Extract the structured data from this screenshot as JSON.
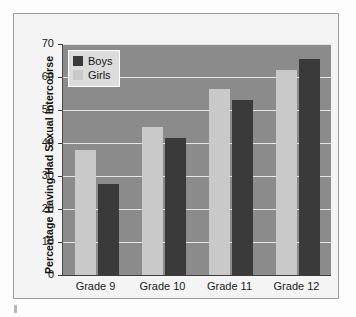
{
  "chart_data": {
    "type": "bar",
    "title": "",
    "subtitle": "",
    "xlabel": "",
    "ylabel": "Percentage Having Had Sexual Intercourse",
    "categories": [
      "Grade 9",
      "Grade 10",
      "Grade 11",
      "Grade 12"
    ],
    "series": [
      {
        "name": "Girls",
        "color": "#c9c9c9",
        "values": [
          38,
          45,
          56.5,
          62
        ]
      },
      {
        "name": "Boys",
        "color": "#3a3a3a",
        "values": [
          27.5,
          41.5,
          53,
          65.5
        ]
      }
    ],
    "series_draw_order": [
      "Girls",
      "Boys"
    ],
    "ylim": [
      0,
      70
    ],
    "ytick_step": 10,
    "yticks": [
      0,
      10,
      20,
      30,
      40,
      50,
      60,
      70
    ],
    "ytick_labels": [
      "0",
      "10",
      "20",
      "30",
      "40",
      "50",
      "60",
      "70"
    ],
    "grid": true,
    "grid_axis": "y",
    "grid_color": "#e6e6e6",
    "plot_background": "#8b8b8b",
    "legend": {
      "position": "upper-left-inside",
      "entries": [
        {
          "label": "Boys",
          "color": "#3a3a3a"
        },
        {
          "label": "Girls",
          "color": "#c9c9c9"
        }
      ]
    },
    "annotations": []
  },
  "figure": {
    "background": "#f4f4f4",
    "border_color": "#9a9a9a",
    "page_background": "#fdfdfd"
  }
}
